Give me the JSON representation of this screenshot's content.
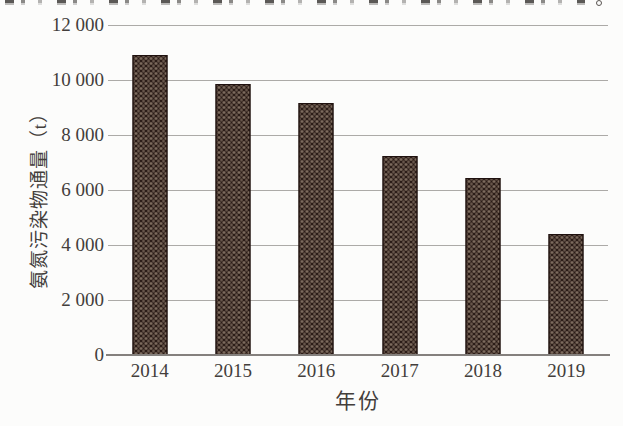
{
  "figure": {
    "kind": "scanned book figure, bar chart",
    "background_color": "#fcfcfb",
    "text_color": "#433e3b",
    "top_edge_note": "bottom slivers of a cropped line of text from the page above the figure"
  },
  "chart_data": {
    "type": "bar",
    "title": "",
    "categories": [
      "2014",
      "2015",
      "2016",
      "2017",
      "2018",
      "2019"
    ],
    "values": [
      10900,
      9850,
      9150,
      7250,
      6450,
      4400
    ],
    "xlabel": "年份",
    "ylabel": "氨氮污染物通量（t）",
    "ylim": [
      0,
      12000
    ],
    "ytick_interval": 2000,
    "ytick_labels": [
      "12 000",
      "10 000",
      "8 000",
      "6 000",
      "4 000",
      "2 000",
      "0"
    ],
    "grid": true,
    "legend": false,
    "bar_style": {
      "fill_color": "#2b1c17",
      "texture": "light dotted weave pattern",
      "dot_color": "#cebaa4",
      "bar_width_px": 35
    },
    "gridline_color": "#acaaa7",
    "axis_line_color": "#84807d"
  }
}
